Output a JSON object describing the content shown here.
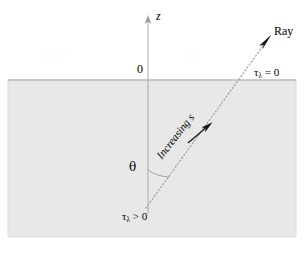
{
  "figure": {
    "canvas": {
      "width": 306,
      "height": 254
    },
    "colors": {
      "background": "#ffffff",
      "slab_fill": "#e8e8e8",
      "slab_edge": "#d8d8d8",
      "line": "#9a9a9a",
      "ink": "#000000",
      "watermark": "#fdfdfd"
    }
  },
  "axes": {
    "z_axis": {
      "label": "z",
      "x": 148,
      "top_y": 17,
      "bottom_y": 214,
      "arrow": "up-arrow-head"
    },
    "origin": {
      "label": "0",
      "x": 148,
      "y": 80
    },
    "surface": {
      "y": 80,
      "x_start": 8,
      "x_end": 296
    }
  },
  "slab": {
    "x": 8,
    "y": 80,
    "width": 288,
    "height": 157
  },
  "ray": {
    "label": "Ray",
    "style": "dotted",
    "start": {
      "x": 146,
      "y": 208
    },
    "surface_crossing": {
      "x": 244,
      "y": 80
    },
    "tip": {
      "x": 270,
      "y": 37
    },
    "direction_label": "Increasing s",
    "direction_arrow": {
      "x": 208,
      "y": 128
    },
    "tip_arrow": "ray-arrow-head"
  },
  "angle": {
    "symbol": "θ",
    "vertex": {
      "x": 148,
      "y": 208
    },
    "arc_radius": 38,
    "from_axis": "z",
    "to": "ray"
  },
  "labels": {
    "tau_symbol": "τ",
    "lambda_sub": "λ",
    "tau_at_surface": " = 0",
    "tau_in_medium": " > 0",
    "tau_at_surface_full": "τλ = 0",
    "tau_in_medium_full": "τλ > 0"
  },
  "watermarks": {
    "left": "Into 1",
    "right": "ing"
  }
}
